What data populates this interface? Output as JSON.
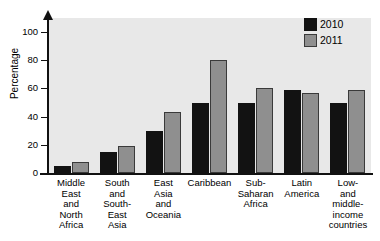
{
  "chart_data": {
    "type": "bar",
    "title": "",
    "xlabel": "",
    "ylabel": "Percentage",
    "ylim": [
      0,
      110
    ],
    "yticks": [
      0,
      20,
      40,
      60,
      80,
      100
    ],
    "grid": false,
    "legend_position": "top-right",
    "categories": [
      "Middle East and North Africa",
      "South and South-East Asia",
      "East Asia and Oceania",
      "Caribbean",
      "Sub-Saharan Africa",
      "Latin America",
      "Low- and middle-income countries"
    ],
    "category_lines": [
      [
        "Middle",
        "East",
        "and",
        "North",
        "Africa"
      ],
      [
        "South",
        "and",
        "South-",
        "East",
        "Asia"
      ],
      [
        "East",
        "Asia",
        "and",
        "Oceania"
      ],
      [
        "Caribbean"
      ],
      [
        "Sub-",
        "Saharan",
        "Africa"
      ],
      [
        "Latin",
        "America"
      ],
      [
        "Low-",
        "and",
        "middle-",
        "income",
        "countries"
      ]
    ],
    "series": [
      {
        "name": "2010",
        "color": "#121212",
        "values": [
          5,
          15,
          30,
          50,
          50,
          59,
          50
        ]
      },
      {
        "name": "2011",
        "color": "#8f8f8f",
        "values": [
          8,
          19,
          43,
          80,
          60,
          57,
          59
        ]
      }
    ]
  },
  "legend": {
    "items": [
      {
        "label": "2010"
      },
      {
        "label": "2011"
      }
    ]
  },
  "axis": {
    "y_title": "Percentage",
    "y_tick_labels": [
      "100",
      "80",
      "60",
      "40",
      "20",
      "0"
    ]
  },
  "colors": {
    "plot_background": "#e8e8e8",
    "series_2010": "#121212",
    "series_2011": "#8f8f8f",
    "axis": "#111111"
  }
}
